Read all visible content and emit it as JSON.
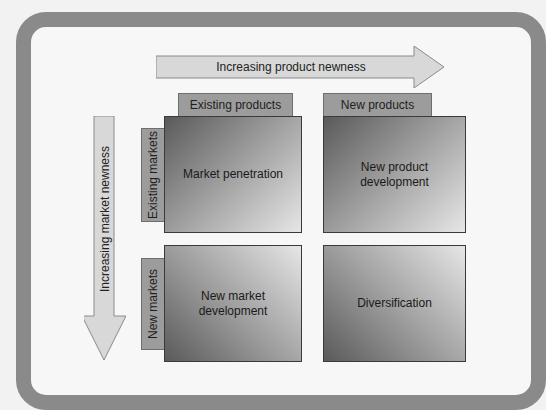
{
  "diagram": {
    "product_axis": {
      "label": "Increasing product newness",
      "direction": "right"
    },
    "market_axis": {
      "label": "Increasing market newness",
      "direction": "down"
    },
    "columns": [
      {
        "label": "Existing products"
      },
      {
        "label": "New products"
      }
    ],
    "rows": [
      {
        "label": "Existing markets"
      },
      {
        "label": "New markets"
      }
    ],
    "cells": [
      {
        "row": 0,
        "col": 0,
        "label": "Market penetration"
      },
      {
        "row": 0,
        "col": 1,
        "label": "New product\ndevelopment"
      },
      {
        "row": 1,
        "col": 0,
        "label": "New market\ndevelopment"
      },
      {
        "row": 1,
        "col": 1,
        "label": "Diversification"
      }
    ]
  },
  "colors": {
    "frame": "#8a8a8a",
    "background": "#f7f7f7",
    "arrow_fill": "#d8d8d8",
    "header_fill": "#9c9c9c",
    "cell_dark": "#5a5a5a",
    "cell_light": "#e6e6e6"
  }
}
